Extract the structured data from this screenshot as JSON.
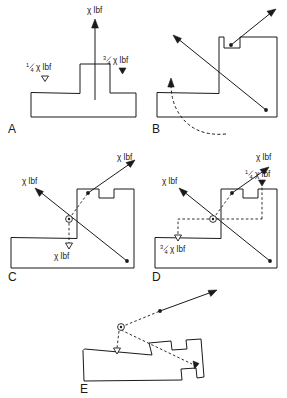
{
  "figure": {
    "panels": [
      {
        "id": "A",
        "letter": "A",
        "labels": {
          "top_force": "χ lbf",
          "left_force_num": "1",
          "left_force_den": "4",
          "left_force_rest": "χ lbf",
          "right_force_num": "3",
          "right_force_den": "4",
          "right_force_rest": "χ lbf"
        }
      },
      {
        "id": "B",
        "letter": "B",
        "labels": {}
      },
      {
        "id": "C",
        "letter": "C",
        "labels": {
          "upper_right_force": "χ lbf",
          "upper_left_force": "χ lbf",
          "lower_force": "χ lbf"
        }
      },
      {
        "id": "D",
        "letter": "D",
        "labels": {
          "upper_right_force": "χ lbf",
          "upper_left_force": "χ lbf",
          "quarter_num": "1",
          "quarter_den": "4",
          "quarter_rest": "χ lbf",
          "three_quarter_num": "3",
          "three_quarter_den": "4",
          "three_quarter_rest": "χ lbf"
        }
      },
      {
        "id": "E",
        "letter": "E",
        "labels": {}
      }
    ],
    "colors": {
      "ink": "#1a1a1a",
      "background": "#ffffff"
    }
  }
}
